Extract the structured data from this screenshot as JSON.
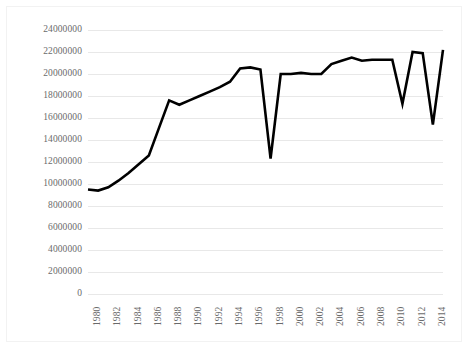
{
  "chart_data": {
    "type": "line",
    "title": "",
    "subtitle": "",
    "xlabel": "",
    "ylabel": "",
    "grid": true,
    "legend": false,
    "legend_position": "none",
    "line_color": "#000000",
    "grid_color": "#e8e8e8",
    "tick_label_color": "#6b6b6b",
    "background_color": "#ffffff",
    "xlim": [
      1980,
      2015
    ],
    "ylim": [
      0,
      24000000
    ],
    "y_ticks": [
      "24000000",
      "22000000",
      "20000000",
      "18000000",
      "16000000",
      "14000000",
      "12000000",
      "10000000",
      "8000000",
      "6000000",
      "4000000",
      "2000000",
      "0"
    ],
    "y_tick_values": [
      24000000,
      22000000,
      20000000,
      18000000,
      16000000,
      14000000,
      12000000,
      10000000,
      8000000,
      6000000,
      4000000,
      2000000,
      0
    ],
    "x_ticks": [
      "1980",
      "1982",
      "1984",
      "1986",
      "1988",
      "1990",
      "1992",
      "1994",
      "1996",
      "1998",
      "2000",
      "2002",
      "2004",
      "2006",
      "2008",
      "2010",
      "2012",
      "2014"
    ],
    "x_tick_values": [
      1980,
      1982,
      1984,
      1986,
      1988,
      1990,
      1992,
      1994,
      1996,
      1998,
      2000,
      2002,
      2004,
      2006,
      2008,
      2010,
      2012,
      2014
    ],
    "x": [
      1980,
      1981,
      1982,
      1983,
      1984,
      1985,
      1986,
      1987,
      1988,
      1989,
      1990,
      1991,
      1992,
      1993,
      1994,
      1995,
      1996,
      1997,
      1998,
      1999,
      2000,
      2001,
      2002,
      2003,
      2004,
      2005,
      2006,
      2007,
      2008,
      2009,
      2010,
      2011,
      2012,
      2013,
      2014,
      2015
    ],
    "values": [
      9500000,
      9400000,
      9700000,
      10300000,
      11000000,
      11800000,
      12600000,
      15100000,
      17600000,
      17200000,
      17600000,
      18000000,
      18400000,
      18800000,
      19300000,
      20500000,
      20600000,
      20400000,
      12300000,
      20000000,
      20000000,
      20100000,
      20000000,
      20000000,
      20900000,
      21200000,
      21500000,
      21200000,
      21300000,
      21300000,
      21300000,
      17300000,
      22000000,
      21900000,
      15400000,
      22200000
    ]
  }
}
